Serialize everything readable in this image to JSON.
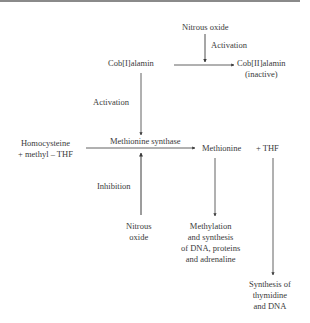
{
  "diagram": {
    "nodes": {
      "nitrous_oxide_top": "Nitrous oxide",
      "activation_top": "Activation",
      "cob1": "Cob[I]alamin",
      "cob2_line1": "Cob[II]alamin",
      "cob2_line2": "(inactive)",
      "activation_left": "Activation",
      "homocysteine_line1": "Homocysteine",
      "homocysteine_line2": "+ methyl – THF",
      "methionine_synthase": "Methionine synthase",
      "methionine": "Methionine",
      "plus_thf": "+  THF",
      "inhibition": "Inhibition",
      "nitrous_bottom_line1": "Nitrous",
      "nitrous_bottom_line2": "oxide",
      "methylation_line1": "Methylation",
      "methylation_line2": "and synthesis",
      "methylation_line3": "of DNA, proteins",
      "methylation_line4": "and adrenaline",
      "synthesis_line1": "Synthesis of",
      "synthesis_line2": "thymidine",
      "synthesis_line3": "and DNA"
    },
    "edges": [
      {
        "from": "Nitrous oxide",
        "to": "Cob[I]alamin → Cob[II]alamin",
        "label": "Activation"
      },
      {
        "from": "Cob[I]alamin",
        "to": "Cob[II]alamin (inactive)"
      },
      {
        "from": "Cob[I]alamin",
        "to": "Methionine synthase",
        "label": "Activation"
      },
      {
        "from": "Homocysteine + methyl – THF",
        "to": "Methionine + THF",
        "label": "Methionine synthase"
      },
      {
        "from": "Nitrous oxide",
        "to": "Methionine synthase",
        "label": "Inhibition"
      },
      {
        "from": "Methionine",
        "to": "Methylation and synthesis of DNA, proteins and adrenaline"
      },
      {
        "from": "THF",
        "to": "Synthesis of thymidine and DNA"
      }
    ]
  }
}
